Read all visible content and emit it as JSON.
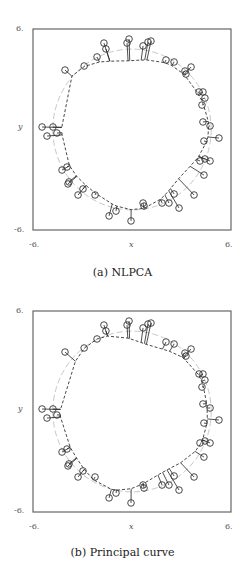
{
  "chart_data": [
    {
      "type": "scatter",
      "title": "",
      "caption": "(a) NLPCA",
      "xlabel": "x",
      "ylabel": "y",
      "xlim": [
        -6,
        6
      ],
      "ylim": [
        -6,
        6
      ],
      "xticks": [
        "-6.",
        "6."
      ],
      "yticks": [
        "6.",
        "-6."
      ],
      "grid": false,
      "legend": null,
      "series": [
        {
          "name": "data points",
          "style": "open circles",
          "points": [
            [
              -4.06,
              3.55
            ],
            [
              -2.9,
              3.79
            ],
            [
              -2.12,
              4.33
            ],
            [
              -1.7,
              5.16
            ],
            [
              -1.58,
              4.81
            ],
            [
              -0.3,
              5.16
            ],
            [
              -0.18,
              5.4
            ],
            [
              0.67,
              4.99
            ],
            [
              0.97,
              5.22
            ],
            [
              1.15,
              5.28
            ],
            [
              2.06,
              4.15
            ],
            [
              2.55,
              4.03
            ],
            [
              3.21,
              3.49
            ],
            [
              3.58,
              3.73
            ],
            [
              3.27,
              3.31
            ],
            [
              4.06,
              2.24
            ],
            [
              4.3,
              2.24
            ],
            [
              4.42,
              1.88
            ],
            [
              4.24,
              1.46
            ],
            [
              4.3,
              0.45
            ],
            [
              4.73,
              0.21
            ],
            [
              5.27,
              -0.51
            ],
            [
              4.36,
              -0.69
            ],
            [
              4.12,
              -1.88
            ],
            [
              4.42,
              -1.76
            ],
            [
              4.73,
              -1.88
            ],
            [
              4.36,
              -2.72
            ],
            [
              3.76,
              -3.91
            ],
            [
              2.55,
              -3.85
            ],
            [
              2.24,
              -4.39
            ],
            [
              2.85,
              -4.69
            ],
            [
              1.82,
              -4.39
            ],
            [
              0.67,
              -4.39
            ],
            [
              0.73,
              -4.57
            ],
            [
              -0.06,
              -5.46
            ],
            [
              -0.97,
              -4.87
            ],
            [
              -1.39,
              -5.16
            ],
            [
              -2.24,
              -3.91
            ],
            [
              -2.97,
              -3.55
            ],
            [
              -3.27,
              -3.91
            ],
            [
              -3.82,
              -3.13
            ],
            [
              -3.88,
              -3.25
            ],
            [
              -4.24,
              -2.42
            ],
            [
              -3.94,
              -2.24
            ],
            [
              -4.55,
              -0.21
            ],
            [
              -4.79,
              0.15
            ],
            [
              -5.15,
              -0.39
            ],
            [
              -5.45,
              0.15
            ]
          ]
        },
        {
          "name": "fitted curve",
          "style": "dark dashed line with projection segments"
        },
        {
          "name": "true circle",
          "style": "light gray dashed circle",
          "radius": 4.8
        }
      ]
    },
    {
      "type": "scatter",
      "title": "",
      "caption": "(b) Principal curve",
      "xlabel": "x",
      "ylabel": "y",
      "xlim": [
        -6,
        6
      ],
      "ylim": [
        -6,
        6
      ],
      "xticks": [
        "-6.",
        "6."
      ],
      "yticks": [
        "6.",
        "-6."
      ],
      "grid": false,
      "legend": null,
      "series": [
        {
          "name": "data points",
          "style": "open circles",
          "points": [
            [
              -4.06,
              3.55
            ],
            [
              -2.9,
              3.79
            ],
            [
              -2.12,
              4.33
            ],
            [
              -1.7,
              5.16
            ],
            [
              -1.58,
              4.81
            ],
            [
              -0.3,
              5.16
            ],
            [
              -0.18,
              5.4
            ],
            [
              0.67,
              4.99
            ],
            [
              0.97,
              5.22
            ],
            [
              1.15,
              5.28
            ],
            [
              2.06,
              4.15
            ],
            [
              2.55,
              4.03
            ],
            [
              3.21,
              3.49
            ],
            [
              3.58,
              3.73
            ],
            [
              3.27,
              3.31
            ],
            [
              4.06,
              2.24
            ],
            [
              4.3,
              2.24
            ],
            [
              4.42,
              1.88
            ],
            [
              4.24,
              1.46
            ],
            [
              4.3,
              0.45
            ],
            [
              4.73,
              0.21
            ],
            [
              5.27,
              -0.51
            ],
            [
              4.36,
              -0.69
            ],
            [
              4.12,
              -1.88
            ],
            [
              4.42,
              -1.76
            ],
            [
              4.73,
              -1.88
            ],
            [
              4.36,
              -2.72
            ],
            [
              3.76,
              -3.91
            ],
            [
              2.55,
              -3.85
            ],
            [
              2.24,
              -4.39
            ],
            [
              2.85,
              -4.69
            ],
            [
              1.82,
              -4.39
            ],
            [
              0.67,
              -4.39
            ],
            [
              0.73,
              -4.57
            ],
            [
              -0.06,
              -5.46
            ],
            [
              -0.97,
              -4.87
            ],
            [
              -1.39,
              -5.16
            ],
            [
              -2.24,
              -3.91
            ],
            [
              -2.97,
              -3.55
            ],
            [
              -3.27,
              -3.91
            ],
            [
              -3.82,
              -3.13
            ],
            [
              -3.88,
              -3.25
            ],
            [
              -4.24,
              -2.42
            ],
            [
              -3.94,
              -2.24
            ],
            [
              -4.55,
              -0.21
            ],
            [
              -4.79,
              0.15
            ],
            [
              -5.15,
              -0.39
            ],
            [
              -5.45,
              0.15
            ]
          ]
        },
        {
          "name": "fitted curve",
          "style": "dark dashed line with projection segments"
        },
        {
          "name": "true circle",
          "style": "light gray dashed circle",
          "radius": 4.8
        }
      ]
    }
  ],
  "layout": {
    "panels": [
      {
        "top": 0,
        "frame": {
          "left": 33,
          "top": 29,
          "width": 198,
          "height": 201
        },
        "caption_top": 264
      },
      {
        "top": 0,
        "frame": {
          "left": 33,
          "top": 311,
          "width": 198,
          "height": 201
        },
        "caption_top": 545
      }
    ]
  }
}
